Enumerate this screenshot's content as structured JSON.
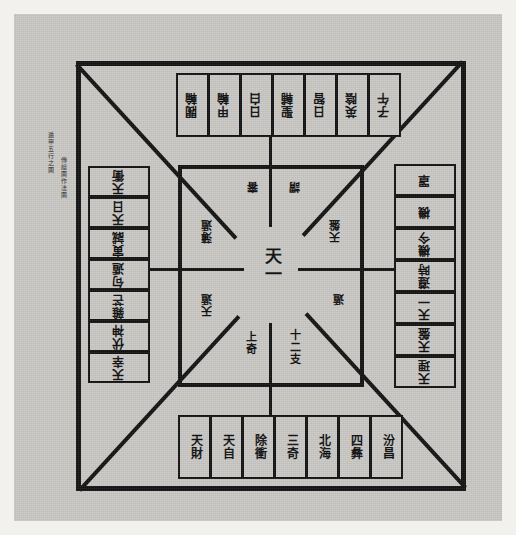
{
  "document": {
    "kind": "woodblock-diagram-scan",
    "title": "遁甲五行之圖",
    "paper_color": "#c9c8c4",
    "ink_color": "#111111",
    "page_color": "#f2f1ee"
  },
  "caption": {
    "line1": "遁甲五行之圖",
    "line2": "傳繪圖作法圖"
  },
  "center": {
    "main_label": "天一",
    "upper_left": "審",
    "upper_right": "謂",
    "mid_upper_left": "薄遁",
    "mid_upper_right": "天盤",
    "mid_lower_left": "天遁",
    "mid_lower_right": "遁",
    "lower_left": "上奇",
    "lower_right": "十二支"
  },
  "top_strip": {
    "orientation": "rotated-180",
    "cells": [
      {
        "label": "閥輪"
      },
      {
        "label": "甲輪"
      },
      {
        "label": "日白"
      },
      {
        "label": "聖輔"
      },
      {
        "label": "日智"
      },
      {
        "label": "英陰"
      },
      {
        "label": "子午"
      }
    ]
  },
  "bottom_strip": {
    "orientation": "upright",
    "cells": [
      {
        "label": "天財"
      },
      {
        "label": "天自"
      },
      {
        "label": "除衝"
      },
      {
        "label": "三奇"
      },
      {
        "label": "北海"
      },
      {
        "label": "四彝"
      },
      {
        "label": "汾昌"
      }
    ]
  },
  "left_stack": {
    "orientation": "rotated-180",
    "cells": [
      {
        "label": "天衝"
      },
      {
        "label": "天日"
      },
      {
        "label": "寅誠"
      },
      {
        "label": "句遁"
      },
      {
        "label": "雜芒"
      },
      {
        "label": "伏神"
      },
      {
        "label": "天幸"
      }
    ]
  },
  "right_stack": {
    "orientation": "rotated-180",
    "cells": [
      {
        "label": "罩"
      },
      {
        "label": "機"
      },
      {
        "label": "機今"
      },
      {
        "label": "遵時"
      },
      {
        "label": "天一"
      },
      {
        "label": "天盤"
      },
      {
        "label": "天理"
      }
    ]
  }
}
